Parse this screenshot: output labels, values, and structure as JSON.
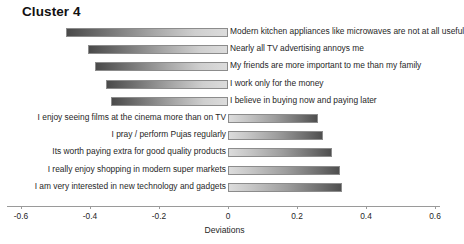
{
  "chart_data": {
    "type": "bar",
    "orientation": "horizontal",
    "title": "Cluster 4",
    "xlabel": "Deviations",
    "ylabel": "",
    "xlim": [
      -0.6,
      0.6
    ],
    "xticks": [
      -0.6,
      -0.4,
      -0.2,
      0,
      0.2,
      0.4,
      0.6
    ],
    "xtick_labels": [
      "-0.6",
      "-0.4",
      "-0.2",
      "0",
      "0.2",
      "0.4",
      "0.6"
    ],
    "grid": false,
    "legend": false,
    "categories": [
      "Modern kitchen appliances like microwaves are not at  all useful",
      "Nearly all TV advertising annoys me",
      "My friends are more important to me than my family",
      "I work only for the money",
      "I believe in buying now and paying later",
      "I enjoy seeing films at the cinema more than on TV",
      "I pray / perform Pujas regularly",
      "Its worth paying extra for good quality products",
      "I really enjoy shopping in modern super markets",
      "I am very interested in new technology and gadgets"
    ],
    "values": [
      -0.47,
      -0.405,
      -0.385,
      -0.355,
      -0.34,
      0.26,
      0.275,
      0.3,
      0.325,
      0.33
    ]
  },
  "colors": {
    "bar_dark": "#4a4a4a",
    "bar_light": "#dcdcdc",
    "axis": "#9a9a9a",
    "text": "#1f1f1f",
    "background": "#ffffff"
  }
}
